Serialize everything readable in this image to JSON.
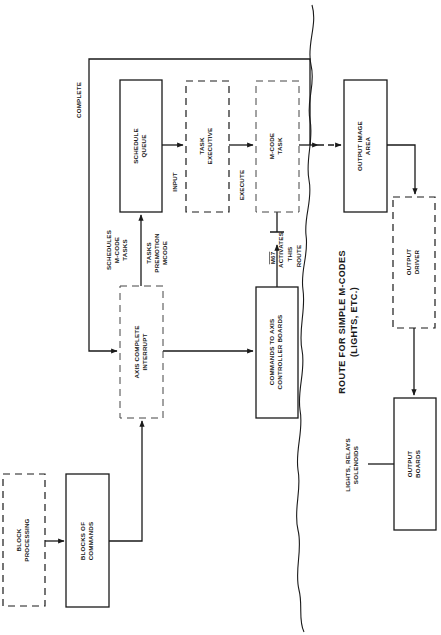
{
  "diagram": {
    "orientation": "rotated-90-ccw",
    "boxes": {
      "block_processing": {
        "line1": "BLOCK",
        "line2": "PROCESSING",
        "style": "dashed"
      },
      "blocks_of_commands": {
        "line1": "BLOCKS OF",
        "line2": "COMMANDS",
        "style": "solid"
      },
      "axis_complete_interrupt": {
        "line1": "AXIS COMPLETE",
        "line2": "INTERRUPT",
        "style": "dashed"
      },
      "schedule_queue": {
        "line1": "SCHEDULE",
        "line2": "QUEUE",
        "style": "solid"
      },
      "task_executive": {
        "line1": "TASK",
        "line2": "EXECUTIVE",
        "style": "dashed"
      },
      "m_code_task": {
        "line1": "M-CODE",
        "line2": "TASK",
        "style": "dashed"
      },
      "commands_to_axis": {
        "line1": "COMMANDS TO AXIS",
        "line2": "CONTROLLER BOARDS",
        "style": "solid"
      },
      "output_image_area": {
        "line1": "OUTPUT IMAGE",
        "line2": "AREA",
        "style": "solid"
      },
      "output_driver": {
        "line1": "OUTPUT",
        "line2": "DRIVER",
        "style": "dashed"
      },
      "output_boards": {
        "line1": "OUTPUT",
        "line2": "BOARDS",
        "style": "solid"
      }
    },
    "labels": {
      "complete": "COMPLETE",
      "schedules": {
        "line1": "SCHEDULES",
        "line2": "M-CODE",
        "line3": "TASKS"
      },
      "tasks_premotion": {
        "line1": "TASKS",
        "line2": "PREMOTION",
        "line3": "MCODE"
      },
      "input": "INPUT",
      "execute": "EXECUTE",
      "m67_activates": {
        "line1": "M67",
        "line2": "ACTIVATES",
        "line3": "THIS",
        "line4": "ROUTE"
      },
      "route_simple": {
        "line1": "ROUTE FOR SIMPLE M-CODES",
        "line2": "(LIGHTS, ETC.)"
      },
      "lights_relays": {
        "line1": "LIGHTS, RELAYS",
        "line2": "SOLENOIDS"
      }
    }
  }
}
